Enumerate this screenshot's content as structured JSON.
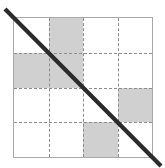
{
  "figure": {
    "name": "shaded-grid-with-diagonal",
    "type": "diagram",
    "canvas": {
      "width": 165,
      "height": 168,
      "background": "#ffffff"
    },
    "square": {
      "left": 13,
      "top": 17,
      "width": 140,
      "height": 141,
      "border_color": "#a9a9a9",
      "border_width": 1.5,
      "fill": "#ffffff"
    },
    "grid": {
      "rows": 4,
      "cols": 4,
      "interior_line_style": "dashed",
      "interior_line_color": "#8e8e8e",
      "interior_line_width": 1.2,
      "vertical_line_positions_pct": [
        25,
        50,
        75
      ],
      "horizontal_line_positions_pct": [
        25,
        50,
        75
      ]
    },
    "cell_fill_color": "#d0d0d0",
    "cells": [
      [
        false,
        true,
        false,
        false
      ],
      [
        true,
        true,
        false,
        false
      ],
      [
        false,
        false,
        false,
        true
      ],
      [
        false,
        false,
        true,
        false
      ]
    ],
    "shaded_cells": [
      {
        "row": 1,
        "col": 2
      },
      {
        "row": 2,
        "col": 1
      },
      {
        "row": 2,
        "col": 2
      },
      {
        "row": 3,
        "col": 4
      },
      {
        "row": 4,
        "col": 3
      }
    ],
    "diagonal": {
      "color": "#2b2b2b",
      "width": 4.2,
      "x1": 5,
      "y1": 9,
      "x2": 161,
      "y2": 166,
      "direction": "top-left-to-bottom-right",
      "extends_beyond_square": true
    }
  }
}
